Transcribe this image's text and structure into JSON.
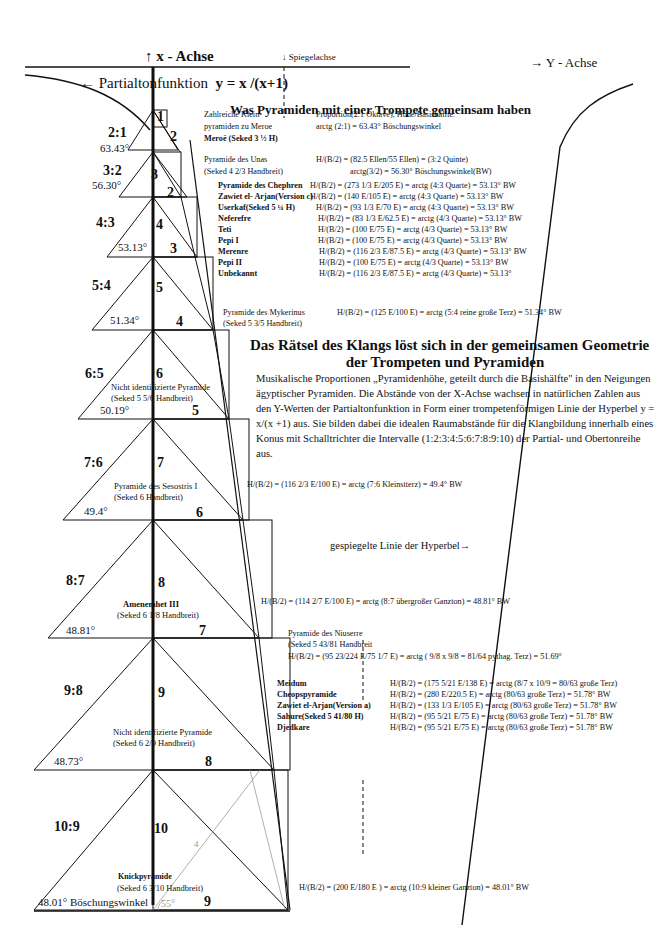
{
  "axes": {
    "x_axis": "x - Achse",
    "mirror_axis": "Spiegelachse",
    "y_axis": "Y - Achse",
    "function_label": "Partialtonfunktion",
    "function_formula": "y = x /(x+1)",
    "mirrored_line": "gespiegelte Linie der Hyperbel→"
  },
  "title": "Was Pyramiden mit einer Trompete gemeinsam haben",
  "subtitle_line1": "Das Rätsel des Klangs löst sich in der gemeinsamen Geometrie",
  "subtitle_line2": "der Trompeten und Pyramiden",
  "paragraph": "Musikalische Proportionen „Pyramidenhöhe, geteilt durch die Basishälfte\" in den Neigungen ägyptischer Pyramiden. Die Abstände von der X-Achse wachsen in natürlichen Zahlen aus den Y-Werten der Partialtonfunktion in Form einer trompetenförmigen Linie der Hyperbel y = x/(x +1) aus. Sie bilden dabei die idealen Raumabstände für die Klangbildung innerhalb eines Konus mit Schalltrichter die Intervalle (1:2:3:4:5:6:7:8:9:10) der Partial- und Obertonreihe aus.",
  "pyramids": [
    {
      "ratio": "2:1",
      "angle": "63.43°",
      "height": "1",
      "half_base": "2"
    },
    {
      "ratio": "3:2",
      "angle": "56.30°",
      "height": "3",
      "half_base": "2"
    },
    {
      "ratio": "4:3",
      "angle": "53.13°",
      "height": "4",
      "half_base": "3"
    },
    {
      "ratio": "5:4",
      "angle": "51.34°",
      "height": "5",
      "half_base": "4"
    },
    {
      "ratio": "6:5",
      "angle": "50.19°",
      "height": "6",
      "half_base": "5",
      "name": "Nicht identifizierte Pyramide",
      "seked": "(Seked 5 5/6 Handbreit)"
    },
    {
      "ratio": "7:6",
      "angle": "49.4°",
      "height": "7",
      "half_base": "6",
      "name": "Pyramide des Sesostris I",
      "seked": "(Seked 6 Handbreit)"
    },
    {
      "ratio": "8:7",
      "angle": "48.81°",
      "height": "8",
      "half_base": "7",
      "name": "Amenemhet III",
      "seked": "(Seked 6 1/8 Handbreit)"
    },
    {
      "ratio": "9:8",
      "angle": "48.73°",
      "height": "9",
      "half_base": "8",
      "name": "Nicht identifizierte Pyramide",
      "seked": "(Seked 6 2/9 Handbreit)"
    },
    {
      "ratio": "10:9",
      "angle": "48.01° Böschungswinkel",
      "height": "10",
      "half_base": "9",
      "name": "Knickpyramide",
      "seked": "(Seked 6 3/10 Handbreit)",
      "pencil_angle": "55°",
      "pencil_mark": "4"
    }
  ],
  "annotations": {
    "meroe": {
      "l1": "Zahlreiche Klein-",
      "l2": "pyramiden zu Meroe",
      "l3": "Meroë (Seked 3 ½ H)",
      "r1": "Proportion(2:1 Oktave), Höhe/Basishälfte:",
      "r2": "arctg (2:1) = 63.43° Böschungswinkel"
    },
    "unas": {
      "l1": "Pyramide des Unas",
      "l2": "(Seked 4 2/3 Handbreit)",
      "r1": "H/(B/2) = (82.5 Ellen/55 Ellen) = (3:2 Quinte)",
      "r2": "arctg(3/2) = 56.30° Böschungswinkel(BW)"
    },
    "quarte_rows": [
      {
        "name": "Pyramide des Chephren",
        "formula": "H/(B/2) = (273 1/3 E/205 E) = arctg (4:3 Quarte) = 53.13° BW"
      },
      {
        "name": "Zawiet el- Arjan(Version c)",
        "formula": "H/(B/2) = (140 E/105 E) = arctg (4:3 Quarte) = 53.13° BW"
      },
      {
        "name": "Userkaf(Seked 5 ¼ H)",
        "formula": "H/(B/2) = (93 1/3 E/70 E) = arctg (4:3 Quarte) = 53.13° BW"
      },
      {
        "name": "Neferefre",
        "formula": "H/(B/2) = (83 1/3 E/62.5 E) = arctg (4/3 Quarte) = 53.13° BW"
      },
      {
        "name": "Teti",
        "formula": "H/(B/2) = (100 E/75 E) = arctg (4/3 Quarte) = 53.13° BW"
      },
      {
        "name": "Pepi I",
        "formula": "H/(B/2) = (100 E/75 E) = arctg (4/3 Quarte) = 53.13° BW"
      },
      {
        "name": "Merenre",
        "formula": "H/(B/2) = (116 2/3 E/87.5 E) = arctg (4/3 Quarte) = 53.13° BW"
      },
      {
        "name": "Pepi II",
        "formula": "H/(B/2) = (100 E/75 E) =  arctg (4/3 Quarte) = 53.13° BW"
      },
      {
        "name": "Unbekannt",
        "formula": "H/(B/2) = (116 2/3 E/87.5 E) = arctg (4/3 Quarte) = 53.13°"
      }
    ],
    "mykerinus": {
      "l1": "Pyramide des Mykerinus",
      "l2": "(Seked 5 3/5 Handbreit)",
      "formula": "H/(B/2) = (125 E/100 E) = arctg (5:4 reine große Terz) = 51.34° BW"
    },
    "sesostris_formula": "H/(B/2) = (116 2/3 E/100 E) = arctg (7:6 Kleinstterz) = 49.4° BW",
    "amenemhet_formula": "H/(B/2) = (114 2/7 E/100 E) = arctg (8:7 übergroßer Ganzton) = 48.81° BW",
    "niuserre": {
      "l1": "Pyramide des Niuserre",
      "l2": "(Seked 5 43/81 Handbreit",
      "formula": "H/(B/2) = (95 23/224 E/75 1/7 E) = arctg ( 9/8 x 9/8 = 81/64 pythag. Terz) = 51.69°"
    },
    "terz_rows": [
      {
        "name": "Meidum",
        "formula": "H/(B/2) = (175 5/21 E/138 E) = arctg (8/7 x 10/9 = 80/63 große Terz)"
      },
      {
        "name": "Cheopspyramide",
        "formula": "H/(B/2) = (280 E/220.5 E) = arctg (80/63 große Terz) = 51.78° BW"
      },
      {
        "name": "Zawiet el-Arjan(Version a)",
        "formula": "H/(B/2) = (133 1/3 E/105 E) = arctg (80/63 große Terz) = 51.78° BW"
      },
      {
        "name": "Sahure(Seked 5 41/80 H)",
        "formula": "H/(B/2) = (95 5/21 E/75 E) = arctg (80/63 große Terz) = 51.78° BW"
      },
      {
        "name": "Djedkare",
        "formula": "H/(B/2) = (95 5/21 E/75 E) = arctg (80/63 große Terz) = 51.78° BW"
      }
    ],
    "knick_formula": "H/(B/2) = (200 E/180 E ) = arctg (10:9 kleiner Ganzton) = 48.01° BW"
  },
  "colors": {
    "ink": "#111111",
    "paper": "#ffffff",
    "pencil": "#9a9a9a"
  }
}
